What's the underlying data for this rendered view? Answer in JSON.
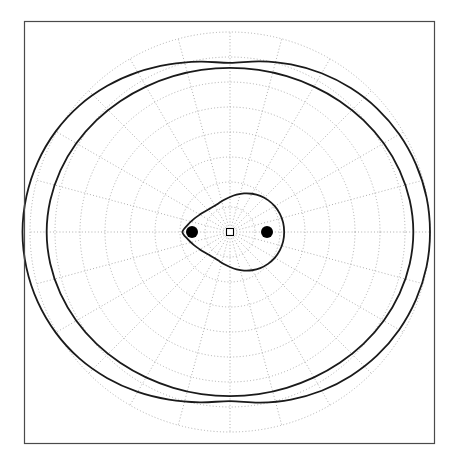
{
  "figure": {
    "title": "",
    "background_color": "#ffffff",
    "frame_color": "#4a4a4a",
    "frame": {
      "x": 24,
      "y": 21,
      "width": 411,
      "height": 423
    }
  },
  "chart_data": {
    "type": "line",
    "plot_kind": "polar",
    "title": "",
    "xlabel": "",
    "ylabel": "",
    "grid": true,
    "legend_position": "none",
    "polar": {
      "center": {
        "x": 230,
        "y": 232
      },
      "angular_gridlines_deg": [
        0,
        15,
        30,
        45,
        60,
        75,
        90,
        105,
        120,
        135,
        150,
        165,
        180,
        195,
        210,
        225,
        240,
        255,
        270,
        285,
        300,
        315,
        330,
        345
      ],
      "radial_gridlines": [
        0.12,
        0.24,
        0.36,
        0.48,
        0.6,
        0.72,
        0.84,
        0.96
      ],
      "radial_gridline_pixels": [
        25,
        50,
        75,
        100,
        125,
        150,
        175,
        200
      ],
      "grid_color": "#9a9a9a",
      "grid_style": "dotted",
      "tick_labels": []
    },
    "curve_color": "#1a1a1a",
    "curve_width": 1.8,
    "foci": [
      {
        "label": "focus-left",
        "x": -0.185,
        "y": 0.0,
        "px": {
          "x": 192,
          "y": 232
        }
      },
      {
        "label": "focus-right",
        "x": 0.185,
        "y": 0.0,
        "px": {
          "x": 267,
          "y": 232
        }
      }
    ],
    "focus_marker": {
      "shape": "circle",
      "color": "#000000",
      "radius_px": 6
    },
    "origin_marker": {
      "shape": "square-open",
      "color": "#000000",
      "size_px": 7
    },
    "series": [
      {
        "name": "inner-oval",
        "kind": "cassini-oval",
        "a_over_c": 1.02,
        "c": 0.185,
        "theta_deg": [
          0,
          10,
          20,
          30,
          40,
          50,
          60,
          70,
          80,
          90,
          100,
          110,
          120,
          130,
          140,
          150,
          160,
          170,
          180,
          190,
          200,
          210,
          220,
          230,
          240,
          250,
          260,
          270,
          280,
          290,
          300,
          310,
          320,
          330,
          340,
          350
        ],
        "r": [
          0.26,
          0.259,
          0.255,
          0.248,
          0.238,
          0.226,
          0.212,
          0.197,
          0.182,
          0.168,
          0.157,
          0.149,
          0.146,
          0.148,
          0.155,
          0.167,
          0.184,
          0.205,
          0.228,
          0.205,
          0.184,
          0.167,
          0.155,
          0.148,
          0.146,
          0.149,
          0.157,
          0.168,
          0.182,
          0.197,
          0.212,
          0.226,
          0.238,
          0.248,
          0.255,
          0.259
        ]
      },
      {
        "name": "middle-oval",
        "kind": "cassini-oval",
        "a_over_c": 4.6,
        "c": 0.185,
        "theta_deg": [
          0,
          10,
          20,
          30,
          40,
          50,
          60,
          70,
          80,
          90,
          100,
          110,
          120,
          130,
          140,
          150,
          160,
          170,
          180,
          190,
          200,
          210,
          220,
          230,
          240,
          250,
          260,
          270,
          280,
          290,
          300,
          310,
          320,
          330,
          340,
          350
        ],
        "r": [
          0.88,
          0.876,
          0.866,
          0.852,
          0.836,
          0.82,
          0.806,
          0.796,
          0.79,
          0.788,
          0.79,
          0.796,
          0.806,
          0.82,
          0.836,
          0.852,
          0.866,
          0.876,
          0.88,
          0.876,
          0.866,
          0.852,
          0.836,
          0.82,
          0.806,
          0.796,
          0.79,
          0.788,
          0.79,
          0.796,
          0.806,
          0.82,
          0.836,
          0.852,
          0.866,
          0.876
        ]
      },
      {
        "name": "outer-oval",
        "kind": "cassini-oval-offset",
        "a_over_c": 5.4,
        "c": 0.185,
        "theta_deg": [
          0,
          10,
          20,
          30,
          40,
          50,
          60,
          70,
          80,
          90,
          100,
          110,
          120,
          130,
          140,
          150,
          160,
          170,
          180,
          190,
          200,
          210,
          220,
          230,
          240,
          250,
          260,
          270,
          280,
          290,
          300,
          310,
          320,
          330,
          340,
          350
        ],
        "r": [
          0.96,
          0.958,
          0.95,
          0.938,
          0.922,
          0.902,
          0.88,
          0.856,
          0.832,
          0.812,
          0.83,
          0.856,
          0.886,
          0.916,
          0.944,
          0.966,
          0.982,
          0.992,
          0.996,
          0.992,
          0.982,
          0.966,
          0.944,
          0.916,
          0.886,
          0.856,
          0.83,
          0.812,
          0.832,
          0.856,
          0.88,
          0.902,
          0.922,
          0.938,
          0.95,
          0.958
        ]
      }
    ],
    "annotations": []
  }
}
